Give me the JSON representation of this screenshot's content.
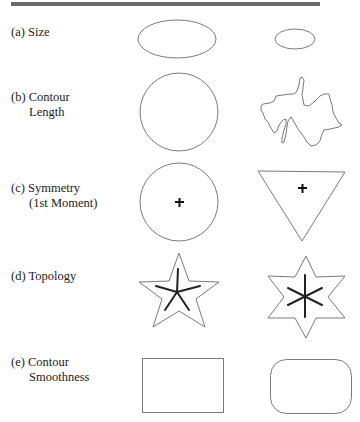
{
  "figure": {
    "rows": [
      {
        "id": "a",
        "label_line1": "(a) Size",
        "label_line2": ""
      },
      {
        "id": "b",
        "label_line1": "(b) Contour",
        "label_line2": "Length"
      },
      {
        "id": "c",
        "label_line1": "(c) Symmetry",
        "label_line2": "(1st Moment)"
      },
      {
        "id": "d",
        "label_line1": "(d) Topology",
        "label_line2": ""
      },
      {
        "id": "e",
        "label_line1": "(e) Contour",
        "label_line2": "Smoothness"
      }
    ],
    "shapes": {
      "a_left": "large-ellipse",
      "a_right": "small-ellipse",
      "b_left": "circle",
      "b_right": "irregular-blob",
      "c_left": "circle-with-centroid",
      "c_right": "inverted-triangle-with-centroid",
      "d_left": "five-point-star-with-skeleton",
      "d_right": "six-point-star-with-skeleton",
      "e_left": "sharp-rectangle",
      "e_right": "rounded-rectangle"
    },
    "colors": {
      "outline": "#7a7a7a",
      "skeleton": "#222222",
      "rule": "#6a6a6a"
    }
  }
}
